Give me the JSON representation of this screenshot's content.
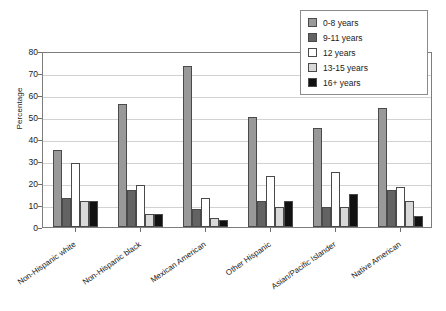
{
  "chart_data": {
    "type": "bar",
    "title": "",
    "subtitle": "",
    "xlabel": "",
    "ylabel": "Percentage",
    "ylim": [
      0,
      80
    ],
    "ytick_values": [
      0,
      10,
      20,
      30,
      40,
      50,
      60,
      70,
      80
    ],
    "ytick_labels": [
      "0",
      "10",
      "20",
      "30",
      "40",
      "50",
      "60",
      "70",
      "80"
    ],
    "grid": true,
    "legend_position": "upper right",
    "categories": [
      "Non-Hispanic white",
      "Non-Hispanic black",
      "Mexican American",
      "Other Hispanic",
      "Asian/Pacific Islander",
      "Native American"
    ],
    "series": [
      {
        "name": "0-8 years",
        "color": "#999999",
        "values": [
          35,
          56,
          73,
          50,
          45,
          54
        ]
      },
      {
        "name": "9-11 years",
        "color": "#636363",
        "values": [
          13,
          17,
          8,
          12,
          9,
          17
        ]
      },
      {
        "name": "12 years",
        "color": "#ffffff",
        "values": [
          29,
          19,
          13,
          23,
          25,
          18
        ]
      },
      {
        "name": "13-15 years",
        "color": "#d9d9d9",
        "values": [
          12,
          6,
          4,
          9,
          9,
          12
        ]
      },
      {
        "name": "16+ years",
        "color": "#111111",
        "values": [
          12,
          6,
          3,
          12,
          15,
          5
        ]
      }
    ]
  }
}
